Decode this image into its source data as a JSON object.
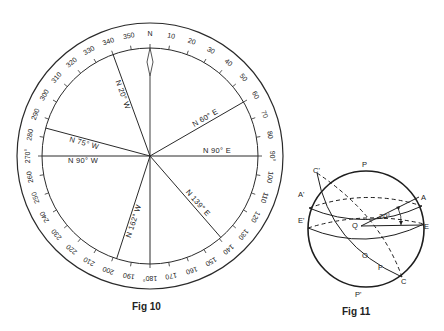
{
  "fig10": {
    "caption": "Fig 10",
    "center": [
      150,
      156
    ],
    "outer_radius": 133,
    "inner_radius": 108,
    "north_label": "N",
    "degree_labels": [
      "N",
      "10",
      "20",
      "30",
      "40",
      "50",
      "60",
      "70",
      "80",
      "90°",
      "100",
      "110",
      "120",
      "130",
      "140",
      "150",
      "160",
      "170",
      "180°",
      "190",
      "200",
      "210",
      "220",
      "230",
      "240",
      "250",
      "260",
      "270°",
      "280",
      "290",
      "300",
      "310",
      "320",
      "330",
      "340",
      "350"
    ],
    "bearings": [
      {
        "label": "N 20° W",
        "angle": 340
      },
      {
        "label": "N 60° E",
        "angle": 60
      },
      {
        "label": "N 75° W",
        "angle": 285
      },
      {
        "label": "N 90° W",
        "angle": 270
      },
      {
        "label": "N 90° E",
        "angle": 90
      },
      {
        "label": "N 139° E",
        "angle": 139
      },
      {
        "label": "N 162° W",
        "angle": 198
      },
      {
        "label": "",
        "angle": 180
      }
    ],
    "colors": {
      "line": "#2a2a2a",
      "background": "#ffffff"
    }
  },
  "fig11": {
    "caption": "Fig 11",
    "points": {
      "P": "P",
      "P_prime": "P'",
      "A": "A",
      "A_prime": "A'",
      "E": "E",
      "E_prime": "E'",
      "C": "C",
      "C_prime": "C'",
      "Q": "Q",
      "O": "O",
      "F": "F"
    },
    "angle_label": "20°"
  }
}
